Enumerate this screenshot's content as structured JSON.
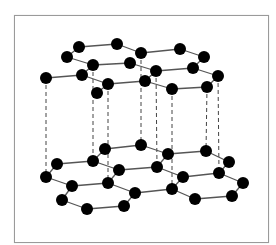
{
  "diagram": {
    "title": "",
    "colors": {
      "atom": "#000000",
      "bond": "#555555",
      "interlayer": "#444444",
      "frame": "#9a9a9a"
    },
    "atom_radius": 6,
    "layers": [
      {
        "name": "top-layer",
        "atoms": {
          "A": [
            79,
            47
          ],
          "B": [
            117,
            44
          ],
          "C": [
            141,
            53
          ],
          "D": [
            180,
            49
          ],
          "E": [
            204,
            57
          ],
          "F": [
            67,
            57
          ],
          "G": [
            93,
            65
          ],
          "H": [
            130,
            63
          ],
          "I": [
            156,
            71
          ],
          "J": [
            193,
            68
          ],
          "K": [
            218,
            76
          ],
          "L": [
            46,
            78
          ],
          "M": [
            82,
            75
          ],
          "N": [
            108,
            84
          ],
          "O": [
            145,
            81
          ],
          "P": [
            172,
            89
          ],
          "Q": [
            207,
            87
          ],
          "R": [
            97,
            93
          ]
        },
        "bonds": [
          [
            "A",
            "B"
          ],
          [
            "B",
            "C"
          ],
          [
            "C",
            "D"
          ],
          [
            "D",
            "E"
          ],
          [
            "A",
            "F"
          ],
          [
            "F",
            "G"
          ],
          [
            "G",
            "H"
          ],
          [
            "H",
            "I"
          ],
          [
            "I",
            "J"
          ],
          [
            "E",
            "J"
          ],
          [
            "J",
            "K"
          ],
          [
            "G",
            "M"
          ],
          [
            "M",
            "L"
          ],
          [
            "M",
            "N"
          ],
          [
            "N",
            "O"
          ],
          [
            "O",
            "I"
          ],
          [
            "O",
            "P"
          ],
          [
            "P",
            "Q"
          ],
          [
            "Q",
            "K"
          ],
          [
            "N",
            "R"
          ]
        ]
      },
      {
        "name": "bottom-layer",
        "atoms": {
          "a": [
            105,
            149
          ],
          "b": [
            141,
            145
          ],
          "c": [
            168,
            154
          ],
          "d": [
            206,
            151
          ],
          "e": [
            229,
            162
          ],
          "f": [
            57,
            164
          ],
          "g": [
            93,
            161
          ],
          "h": [
            119,
            170
          ],
          "i": [
            157,
            167
          ],
          "j": [
            183,
            177
          ],
          "k": [
            219,
            173
          ],
          "l": [
            243,
            183
          ],
          "m": [
            46,
            177
          ],
          "n": [
            72,
            186
          ],
          "o": [
            108,
            183
          ],
          "p": [
            135,
            193
          ],
          "q": [
            172,
            189
          ],
          "r": [
            232,
            196
          ],
          "s": [
            62,
            200
          ],
          "t": [
            87,
            209
          ],
          "u": [
            124,
            206
          ],
          "v": [
            195,
            199
          ]
        },
        "bonds": [
          [
            "a",
            "b"
          ],
          [
            "b",
            "c"
          ],
          [
            "c",
            "d"
          ],
          [
            "d",
            "e"
          ],
          [
            "a",
            "g"
          ],
          [
            "g",
            "f"
          ],
          [
            "f",
            "m"
          ],
          [
            "g",
            "h"
          ],
          [
            "h",
            "i"
          ],
          [
            "i",
            "c"
          ],
          [
            "i",
            "j"
          ],
          [
            "j",
            "k"
          ],
          [
            "k",
            "e"
          ],
          [
            "k",
            "l"
          ],
          [
            "l",
            "r"
          ],
          [
            "r",
            "v"
          ],
          [
            "v",
            "q"
          ],
          [
            "q",
            "j"
          ],
          [
            "h",
            "o"
          ],
          [
            "o",
            "n"
          ],
          [
            "n",
            "m"
          ],
          [
            "n",
            "s"
          ],
          [
            "s",
            "t"
          ],
          [
            "t",
            "u"
          ],
          [
            "u",
            "p"
          ],
          [
            "p",
            "o"
          ],
          [
            "p",
            "q"
          ]
        ]
      }
    ],
    "interlayer_links": [
      [
        "L",
        "m"
      ],
      [
        "G",
        "g"
      ],
      [
        "N",
        "o"
      ],
      [
        "C",
        "b"
      ],
      [
        "I",
        "i"
      ],
      [
        "P",
        "q"
      ],
      [
        "Q",
        "d"
      ],
      [
        "K",
        "k"
      ]
    ]
  }
}
